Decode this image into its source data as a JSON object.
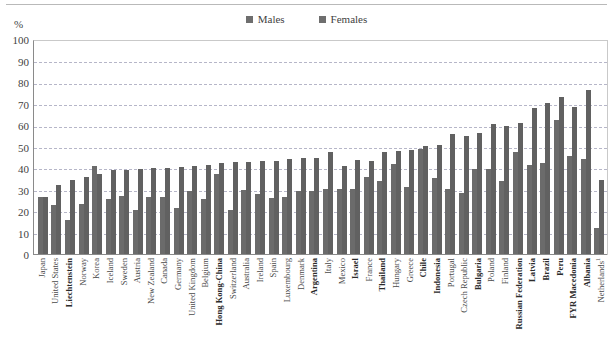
{
  "unit_label": "%",
  "legend": {
    "position": "top-center",
    "entries": [
      {
        "label": "Males",
        "key": "males",
        "color": "#6b6b6b",
        "icon": "square-swatch"
      },
      {
        "label": "Females",
        "key": "females",
        "color": "#616161",
        "icon": "square-swatch"
      }
    ]
  },
  "chart_data": {
    "type": "bar",
    "title": "",
    "subtitle": "",
    "xlabel": "",
    "ylabel": "%",
    "ylim": [
      0,
      100
    ],
    "ytick_step": 10,
    "yticks": [
      100,
      90,
      80,
      70,
      60,
      50,
      40,
      30,
      20,
      10,
      0
    ],
    "grid": true,
    "legend_position": "top-center",
    "orientation": "vertical",
    "grouping": "grouped",
    "categories": [
      "Japan",
      "United States",
      "Liechtenstein",
      "Norway",
      "Korea",
      "Iceland",
      "Sweden",
      "Austria",
      "New Zealand",
      "Canada",
      "Germany",
      "United Kingdom",
      "Belgium",
      "Hong Kong-China",
      "Switzerland",
      "Australia",
      "Ireland",
      "Spain",
      "Luxembourg",
      "Denmark",
      "Argentina",
      "Italy",
      "Mexico",
      "Israel",
      "France",
      "Thailand",
      "Hungary",
      "Greece",
      "Chile",
      "Indonesia",
      "Portugal",
      "Czech Republic",
      "Bulgaria",
      "Poland",
      "Finland",
      "Russian Federation",
      "Latvia",
      "Brazil",
      "Peru",
      "FYR Macedonia",
      "Albania",
      "Netherlands"
    ],
    "category_emphasis": [
      false,
      false,
      true,
      false,
      false,
      false,
      false,
      false,
      false,
      false,
      false,
      false,
      false,
      true,
      false,
      false,
      false,
      false,
      false,
      false,
      true,
      false,
      false,
      true,
      false,
      true,
      false,
      false,
      true,
      true,
      false,
      false,
      true,
      false,
      false,
      true,
      true,
      true,
      true,
      true,
      true,
      false
    ],
    "category_footnotes": {
      "Netherlands": "1"
    },
    "series": [
      {
        "name": "Males",
        "color": "#6b6b6b",
        "values": [
          27,
          23.5,
          16.5,
          24,
          41.5,
          26,
          27.5,
          21,
          27,
          27,
          22,
          30,
          26,
          38,
          21,
          30.5,
          28.5,
          26.5,
          27,
          30,
          30,
          31,
          31,
          31,
          36.5,
          34.5,
          42.5,
          32,
          49.5,
          36,
          31,
          29,
          40,
          40,
          34.5,
          48,
          42,
          43,
          63,
          46.5,
          45,
          12.5
        ]
      },
      {
        "name": "Females",
        "color": "#616161",
        "values": [
          27,
          32.5,
          35,
          36.5,
          38,
          39.5,
          39.5,
          40,
          40.5,
          40.5,
          41,
          41.5,
          42,
          43,
          43.5,
          43.5,
          44,
          44,
          45,
          45.5,
          45.5,
          48,
          41.5,
          44.5,
          44,
          48,
          48.5,
          49,
          51,
          51.5,
          56.5,
          55.5,
          57,
          61,
          60.5,
          61.5,
          68.5,
          71,
          74,
          69,
          77,
          35
        ]
      }
    ]
  }
}
